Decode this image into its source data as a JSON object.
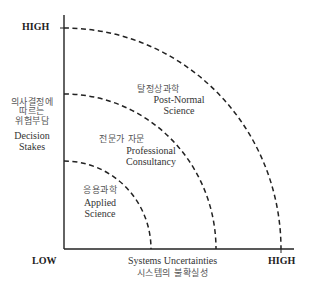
{
  "diagram": {
    "type": "quadrant-arcs",
    "colors": {
      "axis": "#222222",
      "arc": "#222222",
      "text": "#333333",
      "korean_text": "#555555",
      "background": "#ffffff"
    },
    "axes": {
      "y": {
        "high_label": "HIGH",
        "title_ko_lines": [
          "의사결정에",
          "따르는",
          "위험부담"
        ],
        "title_en_lines": [
          "Decision",
          "Stakes"
        ]
      },
      "x": {
        "low_label": "LOW",
        "high_label": "HIGH",
        "title_en": "Systems Uncertainties",
        "title_ko": "시스템의 불확실성"
      }
    },
    "zones": [
      {
        "id": "applied",
        "label_ko": "응용과학",
        "label_en_lines": [
          "Applied",
          "Science"
        ]
      },
      {
        "id": "professional",
        "label_ko": "전문가 자문",
        "label_en_lines": [
          "Professional",
          "Consultancy"
        ]
      },
      {
        "id": "post-normal",
        "label_ko": "탈정상과학",
        "label_en_lines": [
          "Post-Normal",
          "Science"
        ]
      }
    ]
  }
}
